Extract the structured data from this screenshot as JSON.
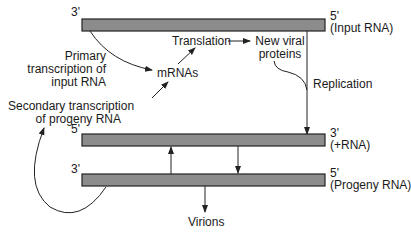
{
  "diagram": {
    "strands": [
      {
        "id": "input",
        "end_left": "3'",
        "end_right": "5'",
        "label": "(Input RNA)"
      },
      {
        "id": "plus",
        "end_left": "5'",
        "end_right": "3'",
        "label": "(+RNA)"
      },
      {
        "id": "progeny",
        "end_left": "3'",
        "end_right": "5'",
        "label": "(Progeny RNA)"
      }
    ],
    "labels": {
      "primary_1": "Primary",
      "primary_2": "transcription of",
      "primary_3": "input RNA",
      "mrnas": "mRNAs",
      "translation": "Translation",
      "new_viral_1": "New viral",
      "new_viral_2": "proteins",
      "replication": "Replication",
      "secondary_1": "Secondary transcription",
      "secondary_2": "of progeny RNA",
      "virions": "Virions"
    },
    "colors": {
      "strand_fill": "#8c8c8c",
      "strand_border": "#222222",
      "line": "#222222",
      "text": "#1a1a1a"
    }
  }
}
